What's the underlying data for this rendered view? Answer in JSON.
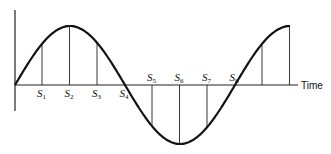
{
  "diagram": {
    "title": "",
    "axis_label": "Time",
    "waveform": "sine",
    "periods_shown": 1.25,
    "samples_per_period": 8,
    "sample_labels": [
      {
        "base": "S",
        "sub": "1"
      },
      {
        "base": "S",
        "sub": "2"
      },
      {
        "base": "S",
        "sub": "3"
      },
      {
        "base": "S",
        "sub": "4"
      },
      {
        "base": "S",
        "sub": "5"
      },
      {
        "base": "S",
        "sub": "6"
      },
      {
        "base": "S",
        "sub": "7"
      },
      {
        "base": "S",
        "sub": "8"
      }
    ],
    "total_sample_lines": 10,
    "colors": {
      "ink": "#111111",
      "background": "#ffffff"
    }
  }
}
